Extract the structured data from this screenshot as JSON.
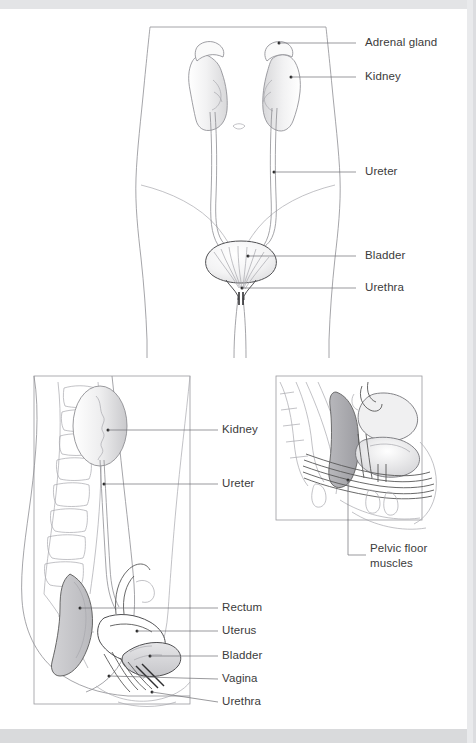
{
  "page": {
    "background_color": "#ffffff",
    "band_color": "#e3e4e6",
    "label_color": "#3b3b3b",
    "leader_color": "#6e6e73",
    "outline_color": "#8e8e93"
  },
  "figures": [
    {
      "id": "anterior-view",
      "name": "anterior-torso-urinary-tract",
      "labels": [
        {
          "key": "adrenal_gland",
          "text": "Adrenal gland"
        },
        {
          "key": "kidney",
          "text": "Kidney"
        },
        {
          "key": "ureter",
          "text": "Ureter"
        },
        {
          "key": "bladder",
          "text": "Bladder"
        },
        {
          "key": "urethra",
          "text": "Urethra"
        }
      ]
    },
    {
      "id": "sagittal-view",
      "name": "sagittal-female-pelvis",
      "labels": [
        {
          "key": "kidney",
          "text": "Kidney"
        },
        {
          "key": "ureter",
          "text": "Ureter"
        },
        {
          "key": "rectum",
          "text": "Rectum"
        },
        {
          "key": "uterus",
          "text": "Uterus"
        },
        {
          "key": "bladder",
          "text": "Bladder"
        },
        {
          "key": "vagina",
          "text": "Vagina"
        },
        {
          "key": "urethra",
          "text": "Urethra"
        }
      ]
    },
    {
      "id": "inset-view",
      "name": "pelvic-floor-inset",
      "labels": [
        {
          "key": "pelvic_floor_muscles",
          "text": "Pelvic floor muscles"
        }
      ]
    }
  ],
  "labels_flat": {
    "adrenal_gland": "Adrenal gland",
    "kidney": "Kidney",
    "ureter": "Ureter",
    "bladder": "Bladder",
    "urethra": "Urethra",
    "rectum": "Rectum",
    "uterus": "Uterus",
    "vagina": "Vagina",
    "pelvic_floor_muscles": "Pelvic floor muscles"
  }
}
